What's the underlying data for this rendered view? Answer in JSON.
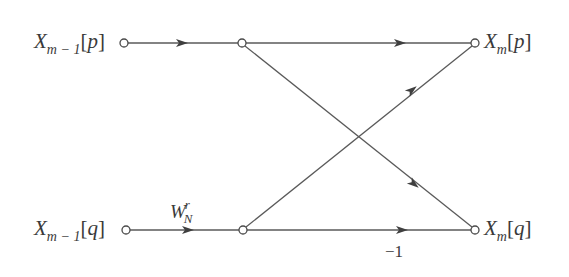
{
  "diagram": {
    "type": "fft-butterfly",
    "colors": {
      "line": "#5a5a5a",
      "text": "#3a3a3a",
      "node_fill": "#ffffff"
    },
    "nodes": {
      "in_p": {
        "x": 124,
        "y": 43,
        "label_var": "X",
        "label_sub": "m − 1",
        "label_idx": "p"
      },
      "in_q": {
        "x": 126,
        "y": 230,
        "label_var": "X",
        "label_sub": "m − 1",
        "label_idx": "q"
      },
      "mid_p": {
        "x": 242,
        "y": 43
      },
      "mid_q": {
        "x": 243,
        "y": 230
      },
      "out_p": {
        "x": 475,
        "y": 43,
        "label_var": "X",
        "label_sub": "m",
        "label_idx": "p"
      },
      "out_q": {
        "x": 475,
        "y": 230,
        "label_var": "X",
        "label_sub": "m",
        "label_idx": "q"
      }
    },
    "edges": [
      {
        "from": "in_p",
        "to": "mid_p",
        "arrow_at": 0.5,
        "label": ""
      },
      {
        "from": "in_q",
        "to": "mid_q",
        "arrow_at": 0.53,
        "label": "W_N^r"
      },
      {
        "from": "mid_p",
        "to": "out_p",
        "arrow_at": 0.68,
        "label": ""
      },
      {
        "from": "mid_p",
        "to": "out_q",
        "arrow_at": 0.74,
        "label": ""
      },
      {
        "from": "mid_q",
        "to": "out_p",
        "arrow_at": 0.73,
        "label": ""
      },
      {
        "from": "mid_q",
        "to": "out_q",
        "arrow_at": 0.68,
        "label": "-1"
      }
    ],
    "labels": {
      "in_p": {
        "var": "X",
        "sub": "m − 1",
        "open": "[",
        "idx": "p",
        "close": "]"
      },
      "in_q": {
        "var": "X",
        "sub": "m − 1",
        "open": "[",
        "idx": "q",
        "close": "]"
      },
      "out_p": {
        "var": "X",
        "sub": "m",
        "open": "[",
        "idx": "p",
        "close": "]"
      },
      "out_q": {
        "var": "X",
        "sub": "m",
        "open": "[",
        "idx": "q",
        "close": "]"
      },
      "twiddle": {
        "var": "W",
        "sub": "N",
        "sup": "r"
      },
      "minus_one": "−1"
    }
  }
}
